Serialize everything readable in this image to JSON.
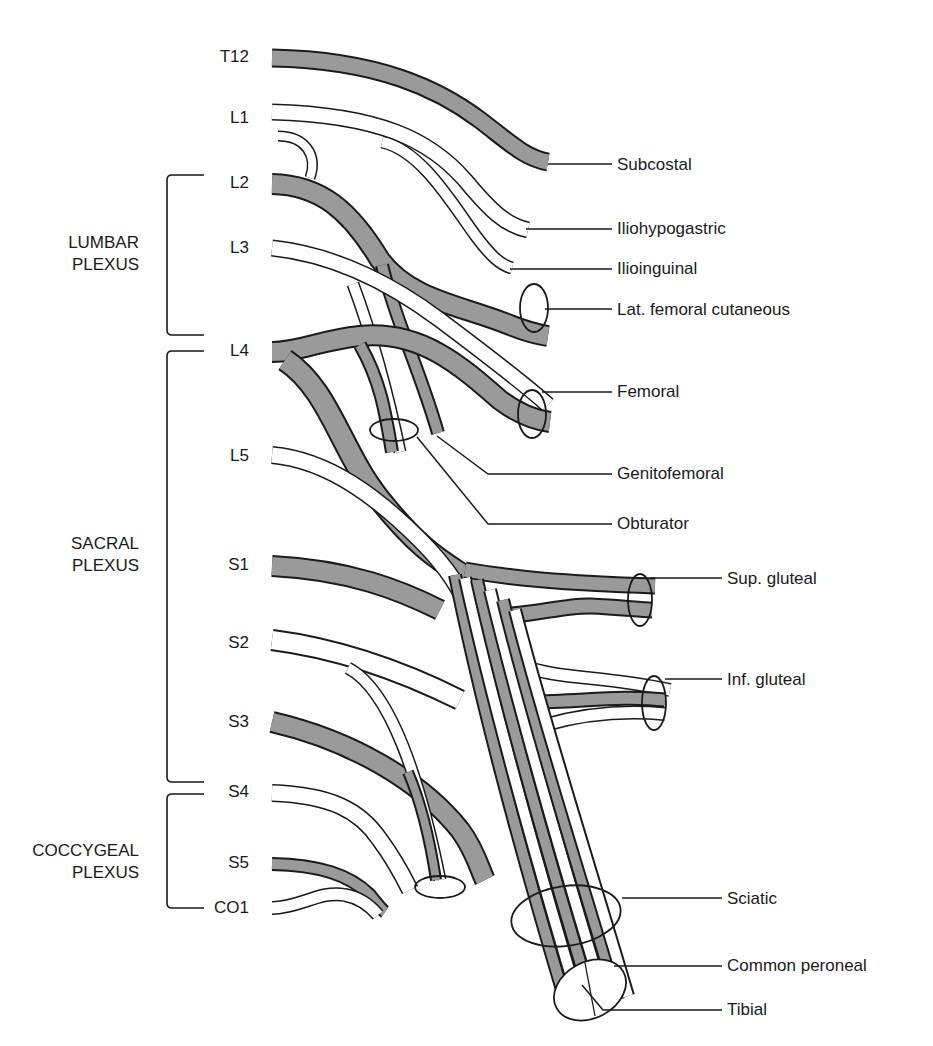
{
  "diagram": {
    "type": "anatomical-schematic",
    "colors": {
      "shaded_nerve": "#9a9a9a",
      "outline": "#1a1a1a",
      "background": "#ffffff"
    },
    "roots": [
      "T12",
      "L1",
      "L2",
      "L3",
      "L4",
      "L5",
      "S1",
      "S2",
      "S3",
      "S4",
      "S5",
      "CO1"
    ],
    "groups": [
      {
        "line1": "LUMBAR",
        "line2": "PLEXUS",
        "from": "L2",
        "to": "L4"
      },
      {
        "line1": "SACRAL",
        "line2": "PLEXUS",
        "from": "L4",
        "to": "S4"
      },
      {
        "line1": "COCCYGEAL",
        "line2": "PLEXUS",
        "from": "S4",
        "to": "CO1"
      }
    ],
    "nerves": [
      "Subcostal",
      "Iliohypogastric",
      "Ilioinguinal",
      "Lat. femoral cutaneous",
      "Femoral",
      "Genitofemoral",
      "Obturator",
      "Sup. gluteal",
      "Inf. gluteal",
      "Sciatic",
      "Common peroneal",
      "Tibial"
    ]
  }
}
